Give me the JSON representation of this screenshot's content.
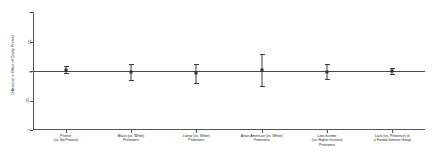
{
  "chart_data": {
    "type": "scatter",
    "title": "",
    "xlabel": "",
    "ylabel": "Difference in Effect of Costly Protest",
    "ylim": [
      -0.1,
      0.1
    ],
    "yticks": [
      0.1,
      0.05,
      0,
      -0.05,
      -0.1
    ],
    "ytick_labels": [
      ".1",
      ".05",
      "0",
      "-.05",
      "-.1"
    ],
    "grid": false,
    "legend": false,
    "zero_reference_line": 0,
    "categories": [
      "Protest (vs. No Protest)",
      "Black (vs. White) Protesters",
      "Latino (vs. White) Protesters",
      "Asian American (vs. White) Protesters",
      "Low-Income (vs. Higher Income) Protesters",
      "Lack (vs. Presence) of a Formal Interest Group"
    ],
    "category_lines": [
      [
        "Protest",
        "(vs. No Protest)"
      ],
      [
        "Black (vs. White)",
        "Protesters"
      ],
      [
        "Latino (vs. White)",
        "Protesters"
      ],
      [
        "Asian American (vs. White)",
        "Protesters"
      ],
      [
        "Low-Income",
        "(vs. Higher Income)",
        "Protesters"
      ],
      [
        "Lack (vs. Presence) of",
        "a Formal Interest Group"
      ]
    ],
    "values": [
      0.002,
      -0.002,
      -0.004,
      0.001,
      -0.001,
      0.0
    ],
    "ci_low": [
      -0.004,
      -0.016,
      -0.02,
      -0.026,
      -0.014,
      -0.005
    ],
    "ci_high": [
      0.008,
      0.012,
      0.012,
      0.028,
      0.012,
      0.005
    ],
    "series": [
      {
        "name": "Difference in Effect of Costly Protest",
        "points": [
          {
            "category": "Protest (vs. No Protest)",
            "estimate": 0.002,
            "ci_low": -0.004,
            "ci_high": 0.008
          },
          {
            "category": "Black (vs. White) Protesters",
            "estimate": -0.002,
            "ci_low": -0.016,
            "ci_high": 0.012
          },
          {
            "category": "Latino (vs. White) Protesters",
            "estimate": -0.004,
            "ci_low": -0.02,
            "ci_high": 0.012
          },
          {
            "category": "Asian American (vs. White) Protesters",
            "estimate": 0.001,
            "ci_low": -0.026,
            "ci_high": 0.028
          },
          {
            "category": "Low-Income (vs. Higher Income) Protesters",
            "estimate": -0.001,
            "ci_low": -0.014,
            "ci_high": 0.012
          },
          {
            "category": "Lack (vs. Presence) of a Formal Interest Group",
            "estimate": 0.0,
            "ci_low": -0.005,
            "ci_high": 0.005
          }
        ]
      }
    ]
  }
}
